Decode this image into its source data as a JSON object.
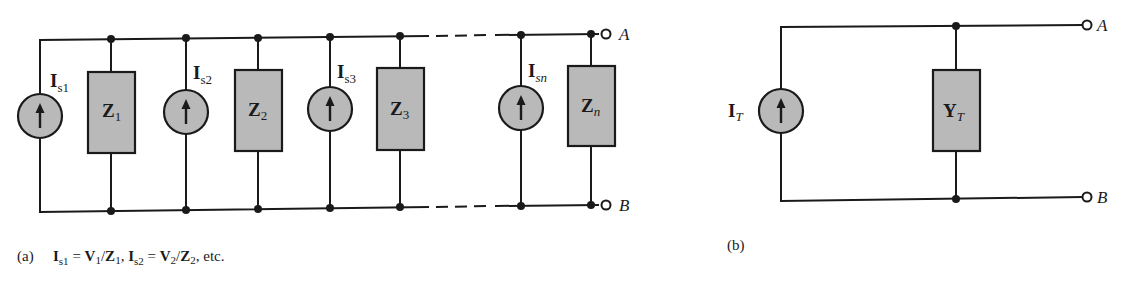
{
  "figure_a": {
    "panel_label": "(a)",
    "sources": [
      {
        "symbol": "I",
        "sub": "s1",
        "sub_italic": false
      },
      {
        "symbol": "I",
        "sub": "s2",
        "sub_italic": false
      },
      {
        "symbol": "I",
        "sub": "s3",
        "sub_italic": false
      },
      {
        "symbol": "I",
        "sub": "sn",
        "sub_italic": true
      }
    ],
    "impedances": [
      {
        "symbol": "Z",
        "sub": "1"
      },
      {
        "symbol": "Z",
        "sub": "2"
      },
      {
        "symbol": "Z",
        "sub": "3"
      },
      {
        "symbol": "Z",
        "sub": "n"
      }
    ],
    "terminals": {
      "top": "A",
      "bottom": "B"
    },
    "caption": {
      "eq1_lhs": "I",
      "eq1_lhs_sub": "s1",
      "eq1_eq": " = ",
      "eq1_v": "V",
      "eq1_v_sub": "1",
      "eq1_slash": "/",
      "eq1_z": "Z",
      "eq1_z_sub": "1",
      "sep": ", ",
      "eq2_lhs": "I",
      "eq2_lhs_sub": "s2",
      "eq2_eq": " = ",
      "eq2_v": "V",
      "eq2_v_sub": "2",
      "eq2_slash": "/",
      "eq2_z": "Z",
      "eq2_z_sub": "2",
      "tail": ", etc."
    }
  },
  "figure_b": {
    "panel_label": "(b)",
    "source": {
      "symbol": "I",
      "sub": "T"
    },
    "admittance": {
      "symbol": "Y",
      "sub": "T"
    },
    "terminals": {
      "top": "A",
      "bottom": "B"
    }
  },
  "colors": {
    "component_fill": "#b9b9b9",
    "line": "#1a1a1a",
    "background": "#ffffff"
  }
}
